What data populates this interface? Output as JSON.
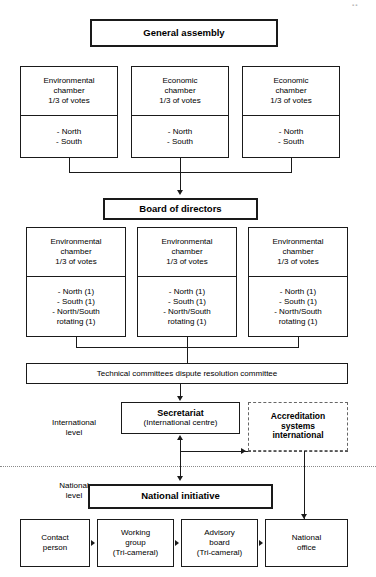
{
  "diagram": {
    "artifact_mark": "▪▪"
  },
  "nodes": {
    "general_assembly": {
      "label": "General assembly"
    },
    "board_of_directors": {
      "label": "Board of directors"
    },
    "assembly_chambers": [
      {
        "name": "Environmental\nchamber\n1/3 of votes",
        "members": "- North\n- South"
      },
      {
        "name": "Economic\nchamber\n1/3 of votes",
        "members": "- North\n- South"
      },
      {
        "name": "Economic\nchamber\n1/3 of votes",
        "members": "- North\n- South"
      }
    ],
    "board_chambers": [
      {
        "name": "Environmental\nchamber\n1/3 of votes",
        "members": "- North (1)\n- South (1)\n- North/South\nrotating (1)"
      },
      {
        "name": "Environmental\nchamber\n1/3 of votes",
        "members": "- North (1)\n- South (1)\n- North/South\nrotating (1)"
      },
      {
        "name": "Environmental\nchamber\n1/3 of votes",
        "members": "- North (1)\n- South (1)\n- North/South\nrotating (1)"
      }
    ],
    "technical_committees": {
      "label": "Technical committees dispute resolution committee"
    },
    "secretariat": {
      "label": "Secretariat",
      "sublabel": "(International centre)"
    },
    "accreditation": {
      "label": "Accreditation\nsystems\ninternational"
    },
    "national_initiative": {
      "label": "National initiative"
    },
    "national_row": [
      {
        "label": "Contact\nperson"
      },
      {
        "label": "Working\ngroup\n(Tri-cameral)"
      },
      {
        "label": "Advisory\nboard\n(Tri-cameral)"
      },
      {
        "label": "National\noffice"
      }
    ]
  },
  "levels": {
    "international": "International\nlevel",
    "national": "National\nlevel"
  },
  "colors": {
    "line": "#1a1a1a",
    "dashed_border": "#666666",
    "divider": "#8a8a8a",
    "background": "#ffffff"
  }
}
